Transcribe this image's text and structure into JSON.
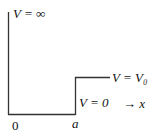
{
  "diagram": {
    "type": "potential-step",
    "line_color": "#333333",
    "labels": {
      "infinite_wall": "V = ∞",
      "step_level": "V = V₀",
      "zero_level": "V = 0",
      "axis": "→ x",
      "origin": "0",
      "step_position": "a"
    },
    "regions": [
      {
        "range": "x < 0",
        "potential": "∞"
      },
      {
        "range": "0 < x < a",
        "potential": "0"
      },
      {
        "range": "x > a",
        "potential": "V₀"
      }
    ]
  }
}
